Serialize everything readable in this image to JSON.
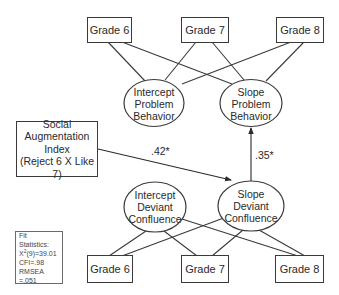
{
  "diagram": {
    "type": "latent growth curve path model",
    "top_indicators": [
      {
        "label": "Grade 6"
      },
      {
        "label": "Grade 7"
      },
      {
        "label": "Grade 8"
      }
    ],
    "bottom_indicators": [
      {
        "label": "Grade 6"
      },
      {
        "label": "Grade 7"
      },
      {
        "label": "Grade 8"
      }
    ],
    "latent_factors": {
      "intercept_problem_behavior": {
        "lines": [
          "Intercept",
          "Problem",
          "Behavior"
        ]
      },
      "slope_problem_behavior": {
        "lines": [
          "Slope",
          "Problem",
          "Behavior"
        ]
      },
      "intercept_deviant_confluence": {
        "lines": [
          "Intercept",
          "Deviant",
          "Confluence"
        ]
      },
      "slope_deviant_confluence": {
        "lines": [
          "Slope",
          "Deviant",
          "Confluence"
        ]
      }
    },
    "predictor": {
      "lines": [
        "Social",
        "Augmentation",
        "Index",
        "(Reject 6 X Like 7)"
      ]
    },
    "paths": [
      {
        "from": "Social Augmentation Index",
        "to": "Slope Deviant Confluence",
        "coefficient": ".42*"
      },
      {
        "from": "Slope Deviant Confluence",
        "to": "Slope Problem Behavior",
        "coefficient": ".35*"
      }
    ],
    "fit_statistics": {
      "title_line1": "Fit",
      "title_line2": "Statistics:",
      "chi_square_prefix": "X",
      "chi_square_sup": "2",
      "chi_square_value": "(9)=39.01",
      "cfi": "CFI=.98",
      "rmsea": "RMSEA =.051"
    },
    "colors": {
      "line": "#3a3a3a",
      "text": "#2a2a2a",
      "background": "#ffffff"
    }
  }
}
